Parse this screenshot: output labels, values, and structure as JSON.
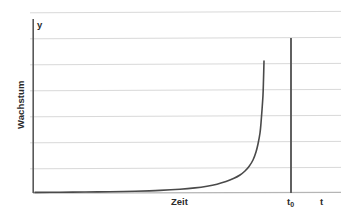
{
  "figure": {
    "background_color": "#ffffff",
    "width": 349,
    "height": 219
  },
  "labels": {
    "y_axis_symbol": "y",
    "y_axis_name": "Wachstum",
    "x_axis_name": "Zeit",
    "x_axis_symbol": "t",
    "threshold_label_base": "t",
    "threshold_label_sub": "0"
  },
  "colors": {
    "axis": "#595959",
    "grid": "#d9d9d9",
    "curve": "#4a4a4a",
    "threshold_line": "#595959",
    "text": "#2b2b2b"
  },
  "chart_data": {
    "type": "line",
    "title": "",
    "xlabel": "Zeit",
    "ylabel": "Wachstum",
    "x_axis_symbol": "t",
    "y_axis_symbol": "y",
    "grid": true,
    "grid_orientation": "horizontal",
    "gridline_count": 7,
    "gridline_y_px": [
      12,
      38,
      64,
      90,
      116,
      142,
      168
    ],
    "legend": null,
    "xlim": [
      0,
      1
    ],
    "ylim": [
      0,
      1
    ],
    "tick_labels_x": [],
    "tick_labels_y": [],
    "annotations": [
      {
        "name": "threshold-line",
        "label": "t0",
        "type": "vertical-line",
        "x_px": 291,
        "y_top_px": 38,
        "y_bottom_px": 193
      }
    ],
    "series": [
      {
        "name": "exponentielles Wachstum",
        "color": "#4a4a4a",
        "points_px": [
          [
            35,
            192.4
          ],
          [
            60,
            192.2
          ],
          [
            85,
            192.0
          ],
          [
            110,
            191.7
          ],
          [
            135,
            191.2
          ],
          [
            160,
            190.4
          ],
          [
            180,
            189.3
          ],
          [
            195,
            187.9
          ],
          [
            207,
            186.2
          ],
          [
            217,
            184.2
          ],
          [
            226,
            181.6
          ],
          [
            234,
            178.3
          ],
          [
            240,
            175.0
          ],
          [
            245,
            171.0
          ],
          [
            249,
            166.5
          ],
          [
            253,
            160.0
          ],
          [
            256,
            152.0
          ],
          [
            258,
            144.0
          ],
          [
            260,
            133.0
          ],
          [
            261,
            123.0
          ],
          [
            262,
            110.0
          ],
          [
            263,
            95.0
          ],
          [
            263.5,
            80.0
          ],
          [
            264,
            61.0
          ]
        ],
        "normalized": {
          "x": [
            0.0,
            0.08,
            0.16,
            0.25,
            0.33,
            0.41,
            0.48,
            0.52,
            0.57,
            0.6,
            0.63,
            0.66,
            0.68,
            0.69,
            0.7,
            0.71,
            0.73,
            0.74,
            0.75,
            0.755,
            0.76,
            0.765,
            0.77,
            0.775
          ],
          "y": [
            0.003,
            0.005,
            0.007,
            0.008,
            0.011,
            0.015,
            0.021,
            0.029,
            0.039,
            0.05,
            0.064,
            0.083,
            0.102,
            0.125,
            0.151,
            0.188,
            0.234,
            0.28,
            0.343,
            0.401,
            0.476,
            0.562,
            0.648,
            0.758
          ]
        }
      }
    ]
  }
}
